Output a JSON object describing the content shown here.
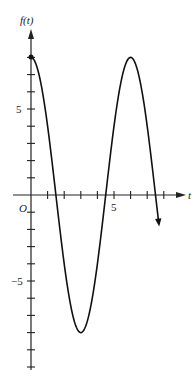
{
  "chart_data": {
    "type": "line",
    "title": "",
    "xlabel": "t",
    "ylabel": "f(t)",
    "origin_label": "O",
    "function": "f(t) = 8 cos(pi t / 3)",
    "x_ticks": [
      1,
      2,
      3,
      4,
      5,
      6,
      7,
      8
    ],
    "x_tick_labels": {
      "5": "5"
    },
    "y_ticks": [
      -10,
      -9,
      -8,
      -7,
      -6,
      -5,
      -4,
      -3,
      -2,
      -1,
      1,
      2,
      3,
      4,
      5,
      6,
      7,
      8
    ],
    "y_tick_labels": {
      "5": "5",
      "-5": "-5"
    },
    "xlim": [
      0,
      8.5
    ],
    "ylim": [
      -10.5,
      10
    ],
    "grid": false,
    "series": [
      {
        "name": "f(t)",
        "x": [
          0,
          0.5,
          1,
          1.5,
          2,
          2.5,
          3,
          3.5,
          4,
          4.5,
          5,
          5.5,
          6,
          6.5,
          7,
          7.5,
          7.7
        ],
        "values": [
          8,
          6.93,
          4,
          0,
          -4,
          -6.93,
          -8,
          -6.93,
          -4,
          0,
          4,
          6.93,
          8,
          6.93,
          4,
          0,
          -1.76
        ]
      }
    ],
    "annotations": [
      "filled dot at (0, 8)",
      "arrowhead at curve end near t=7.7"
    ]
  },
  "axes": {
    "x_label": "t",
    "y_label": "f(t)",
    "origin": "O",
    "tick5": "5",
    "tickm5": "−5",
    "tick5y": "5"
  }
}
